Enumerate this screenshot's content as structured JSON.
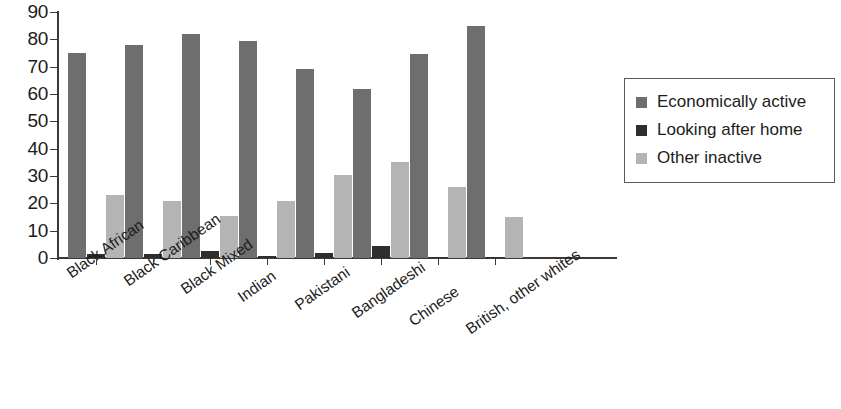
{
  "chart_data": {
    "type": "bar",
    "title": "",
    "subtitle": "",
    "xlabel": "",
    "ylabel": "",
    "ylim": [
      0,
      90
    ],
    "ytick_step": 10,
    "yticks": [
      "0",
      "10",
      "20",
      "30",
      "40",
      "50",
      "60",
      "70",
      "80",
      "90"
    ],
    "grid": false,
    "legend_position": "right",
    "categories": [
      "Black African",
      "Black Caribbean",
      "Black Mixed",
      "Indian",
      "Pakistani",
      "Bangladeshi",
      "Chinese",
      "British, other whites"
    ],
    "series": [
      {
        "name": "Economically active",
        "color": "#6e6e6e",
        "values": [
          75,
          78,
          82,
          79.5,
          69,
          62,
          74.5,
          85
        ]
      },
      {
        "name": "Looking after home",
        "color": "#2e2e2e",
        "values": [
          1.5,
          1.5,
          2.5,
          0.8,
          1.8,
          4.5,
          0.5,
          0.4
        ]
      },
      {
        "name": "Other inactive",
        "color": "#b4b4b4",
        "values": [
          23,
          21,
          15.5,
          21,
          30.5,
          35,
          26,
          15
        ]
      }
    ]
  },
  "legend": {
    "items": [
      {
        "label": "Economically active",
        "color": "#6e6e6e"
      },
      {
        "label": "Looking after home",
        "color": "#2e2e2e"
      },
      {
        "label": "Other inactive",
        "color": "#b4b4b4"
      }
    ]
  },
  "axis": {
    "y_min_label": "0",
    "y_max_label": "90"
  }
}
